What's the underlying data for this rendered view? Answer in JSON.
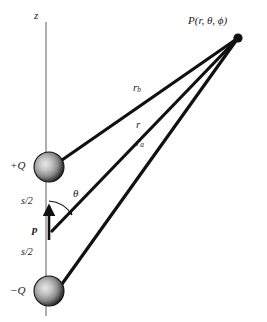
{
  "figure": {
    "background_color": "#ffffff",
    "axis": {
      "label": "z",
      "color": "#9a9a9a",
      "x": 46,
      "y_top": 22,
      "y_bottom": 316
    },
    "field_point": {
      "label": "P(r, θ, ϕ)",
      "dot_color": "#111111",
      "x": 238,
      "y": 38
    },
    "charges": [
      {
        "name": "positive-charge",
        "label": "+Q",
        "x": 49,
        "y": 167,
        "radius": 15,
        "sphere_dark": "#1b1b1b",
        "sphere_light": "#cfcfcf"
      },
      {
        "name": "negative-charge",
        "label": "−Q",
        "x": 49,
        "y": 291,
        "radius": 15,
        "sphere_dark": "#1b1b1b",
        "sphere_light": "#cfcfcf"
      }
    ],
    "distance_lines": [
      {
        "name": "r-b-line",
        "label": "r",
        "subscript": "b",
        "from_x": 62,
        "from_y": 160,
        "to_x": 238,
        "to_y": 38,
        "stroke_width": 3.2,
        "color": "#111111"
      },
      {
        "name": "r-line",
        "label": "r",
        "subscript": "",
        "from_x": 52,
        "from_y": 231,
        "to_x": 238,
        "to_y": 38,
        "stroke_width": 3.2,
        "color": "#111111"
      },
      {
        "name": "r-a-line",
        "label": "r",
        "subscript": "a",
        "from_x": 62,
        "from_y": 284,
        "to_x": 238,
        "to_y": 38,
        "stroke_width": 3.2,
        "color": "#111111"
      }
    ],
    "thin_guides": [
      {
        "name": "guide-upper",
        "from_x": 62,
        "from_y": 160,
        "to_x": 238,
        "to_y": 38,
        "color": "#6e6e6e",
        "stroke_width": 0.6
      },
      {
        "name": "guide-lower",
        "from_x": 62,
        "from_y": 284,
        "to_x": 238,
        "to_y": 38,
        "color": "#6e6e6e",
        "stroke_width": 0.6
      }
    ],
    "half_separations": [
      {
        "name": "s-over-2-upper",
        "label": "s/2"
      },
      {
        "name": "s-over-2-lower",
        "label": "s/2"
      }
    ],
    "dipole_moment": {
      "label": "p",
      "color": "#111111",
      "tail_x": 49,
      "tail_y": 236,
      "head_x": 49,
      "head_y": 205
    },
    "angle": {
      "label": "θ",
      "arc_color": "#111111",
      "vertex_x": 49,
      "vertex_y": 231,
      "radius": 30
    }
  }
}
